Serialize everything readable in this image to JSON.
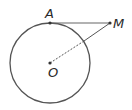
{
  "diagram": {
    "type": "geometry",
    "colors": {
      "stroke": "#555555",
      "point": "#333333",
      "label": "#2a2a2a"
    },
    "circle": {
      "center_label": "O",
      "cx": 50,
      "cy": 63,
      "r": 40
    },
    "points": [
      {
        "id": "A",
        "label": "A",
        "x": 50,
        "y": 23
      },
      {
        "id": "M",
        "label": "M",
        "x": 110,
        "y": 23
      },
      {
        "id": "O",
        "label": "O",
        "x": 50,
        "y": 63
      }
    ],
    "segments": [
      {
        "from": "A",
        "to": "M",
        "style": "solid"
      },
      {
        "from": "O",
        "to": "M",
        "style": "dashed inside circle, solid outside"
      }
    ]
  }
}
